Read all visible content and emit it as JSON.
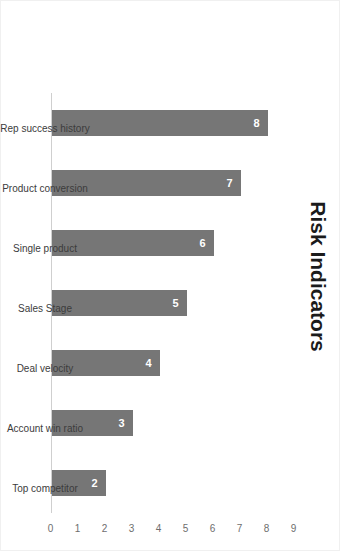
{
  "chart_data": {
    "type": "bar",
    "orientation": "vertical-rotated-90cw",
    "title": "Risk Indicators",
    "xlabel": "",
    "ylabel": "",
    "categories": [
      "Rep success history",
      "Product conversion",
      "Single product",
      "Sales Stage",
      "Deal velocity",
      "Account win ratio",
      "Top competitor"
    ],
    "values": [
      8,
      7,
      6,
      5,
      4,
      3,
      2
    ],
    "value_labels": [
      "8",
      "7",
      "6",
      "5",
      "4",
      "3",
      "2"
    ],
    "ylim": [
      0,
      9
    ],
    "yticks": [
      0,
      1,
      2,
      3,
      4,
      5,
      6,
      7,
      8,
      9
    ],
    "ytick_labels": [
      "0",
      "1",
      "2",
      "3",
      "4",
      "5",
      "6",
      "7",
      "8",
      "9"
    ],
    "grid": false,
    "legend": null,
    "bar_color": "#767676",
    "value_label_color": "#ffffff",
    "axis_color": "#cfcfcf",
    "tick_label_color": "#6e6e6e",
    "category_label_color": "#3c3c3c",
    "title_color": "#1b1b1b",
    "background_color": "#ffffff"
  }
}
